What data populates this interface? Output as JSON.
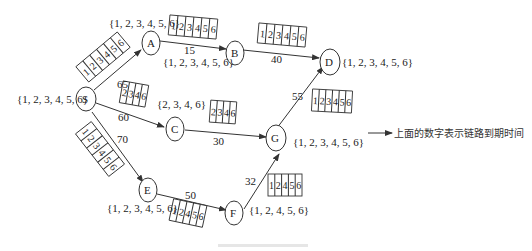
{
  "diagram": {
    "nodes": [
      {
        "id": "S",
        "label": "S",
        "set": "{1, 2, 3, 4, 5, 6}"
      },
      {
        "id": "A",
        "label": "A",
        "set": "{1, 2, 3, 4, 5, 6}"
      },
      {
        "id": "B",
        "label": "B",
        "set": "{1, 2, 3, 4, 5, 6}"
      },
      {
        "id": "C",
        "label": "C",
        "set": "{2, 3, 4, 6}"
      },
      {
        "id": "D",
        "label": "D",
        "set": "{1, 2, 3, 4, 5, 6}"
      },
      {
        "id": "E",
        "label": "E",
        "set": "{1, 2, 3, 4, 5, 6}"
      },
      {
        "id": "F",
        "label": "F",
        "set": "{1, 2, 4, 5, 6}"
      },
      {
        "id": "G",
        "label": "G",
        "set": "{1, 2, 3, 4, 5, 6}"
      }
    ],
    "edges": [
      {
        "from": "S",
        "to": "A",
        "weight": "",
        "slots": [
          "1",
          "2",
          "3",
          "4",
          "5",
          "6"
        ]
      },
      {
        "from": "S",
        "to": "C",
        "weight": "60",
        "weight2": "65",
        "slots": [
          "2",
          "3",
          "4",
          "6"
        ]
      },
      {
        "from": "S",
        "to": "E",
        "weight": "70",
        "slots": [
          "1",
          "2",
          "3",
          "4",
          "5",
          "6"
        ]
      },
      {
        "from": "A",
        "to": "B",
        "weight": "15",
        "slots": [
          "1",
          "2",
          "3",
          "4",
          "5",
          "6"
        ]
      },
      {
        "from": "B",
        "to": "D",
        "weight": "40",
        "slots": [
          "1",
          "2",
          "3",
          "4",
          "5",
          "6"
        ]
      },
      {
        "from": "C",
        "to": "G",
        "weight": "30",
        "slots": [
          "2",
          "3",
          "4",
          "6"
        ]
      },
      {
        "from": "G",
        "to": "D",
        "weight": "55",
        "slots": [
          "1",
          "2",
          "3",
          "4",
          "5",
          "6"
        ]
      },
      {
        "from": "E",
        "to": "F",
        "weight": "50",
        "slots": [
          "1",
          "2",
          "4",
          "5",
          "6"
        ]
      },
      {
        "from": "F",
        "to": "G",
        "weight": "32",
        "slots": [
          "1",
          "2",
          "4",
          "5",
          "6"
        ]
      }
    ],
    "legend": {
      "text": "上面的数字表示链路到期时间"
    }
  }
}
